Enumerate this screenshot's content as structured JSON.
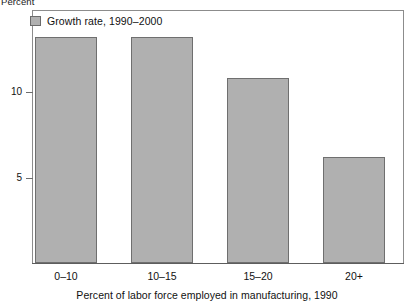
{
  "chart_data": {
    "type": "bar",
    "title": "",
    "categories": [
      "0–10",
      "10–15",
      "15–20",
      "20+"
    ],
    "values": [
      13.2,
      13.2,
      10.8,
      6.2
    ],
    "series": [
      {
        "name": "Growth rate, 1990–2000",
        "values": [
          13.2,
          13.2,
          10.8,
          6.2
        ],
        "color": "#b0b0b0"
      }
    ],
    "xlabel": "Percent of labor force employed in manufacturing, 1990",
    "ylabel": "Percent",
    "ylim": [
      0,
      14.75
    ],
    "yticks": [
      5,
      10
    ],
    "ytick_labels": [
      "5",
      "10"
    ],
    "grid": false,
    "legend_position": "top-left",
    "legend_entries": [
      "Growth rate, 1990–2000"
    ],
    "bar_color": "#b0b0b0",
    "bar_edge_color": "#6f6f6f",
    "frame_color": "#8c8c8c"
  },
  "labels": {
    "yaxis_unit": "Percent",
    "legend_label": "Growth rate, 1990–2000",
    "ytick_10": "10",
    "ytick_5": "5",
    "xtick_0": "0–10",
    "xtick_1": "10–15",
    "xtick_2": "15–20",
    "xtick_3": "20+",
    "xaxis_title": "Percent of labor force employed in manufacturing, 1990"
  }
}
